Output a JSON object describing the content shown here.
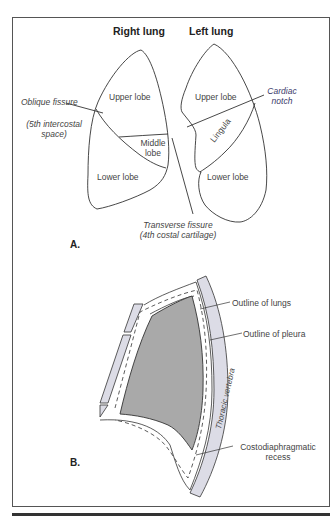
{
  "figure": {
    "part_a": {
      "label": "A.",
      "headings": {
        "right_lung": "Right lung",
        "left_lung": "Left lung"
      },
      "right_lung": {
        "upper_lobe": "Upper lobe",
        "middle_lobe_line1": "Middle",
        "middle_lobe_line2": "lobe",
        "lower_lobe": "Lower lobe"
      },
      "left_lung": {
        "upper_lobe": "Upper lobe",
        "lingula": "Lingula",
        "lower_lobe": "Lower lobe"
      },
      "annotations": {
        "oblique_fissure": "Oblique fissure",
        "oblique_fissure_note_line1": "(5th intercostal",
        "oblique_fissure_note_line2": "space)",
        "cardiac_notch_line1": "Cardiac",
        "cardiac_notch_line2": "notch",
        "transverse_fissure": "Transverse fissure",
        "transverse_fissure_note": "(4th costal cartilage)"
      }
    },
    "part_b": {
      "label": "B.",
      "annotations": {
        "outline_of_lungs": "Outline of lungs",
        "outline_of_pleura": "Outline of pleura",
        "thoracic_vertebra": "Thoracic vertebra",
        "costodiaphragmatic_line1": "Costodiaphragmatic",
        "costodiaphragmatic_line2": "recess"
      }
    },
    "colors": {
      "outline": "#333333",
      "lung_fill": "#a9a9a9",
      "bone_fill": "#dcdce6",
      "label_text": "#444444",
      "cardiac_notch_text": "#3a3a6a"
    }
  }
}
